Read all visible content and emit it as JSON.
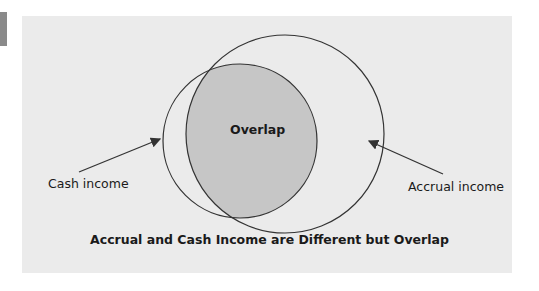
{
  "diagram": {
    "type": "venn",
    "circles": [
      {
        "label": "Cash income"
      },
      {
        "label": "Accrual income"
      }
    ],
    "intersection_label": "Overlap",
    "caption": "Accrual and Cash Income are Different but Overlap"
  },
  "colors": {
    "panel": "#ebebeb",
    "overlap_fill": "#c6c6c6",
    "stroke": "#333333",
    "tab": "#8a8a8a"
  }
}
